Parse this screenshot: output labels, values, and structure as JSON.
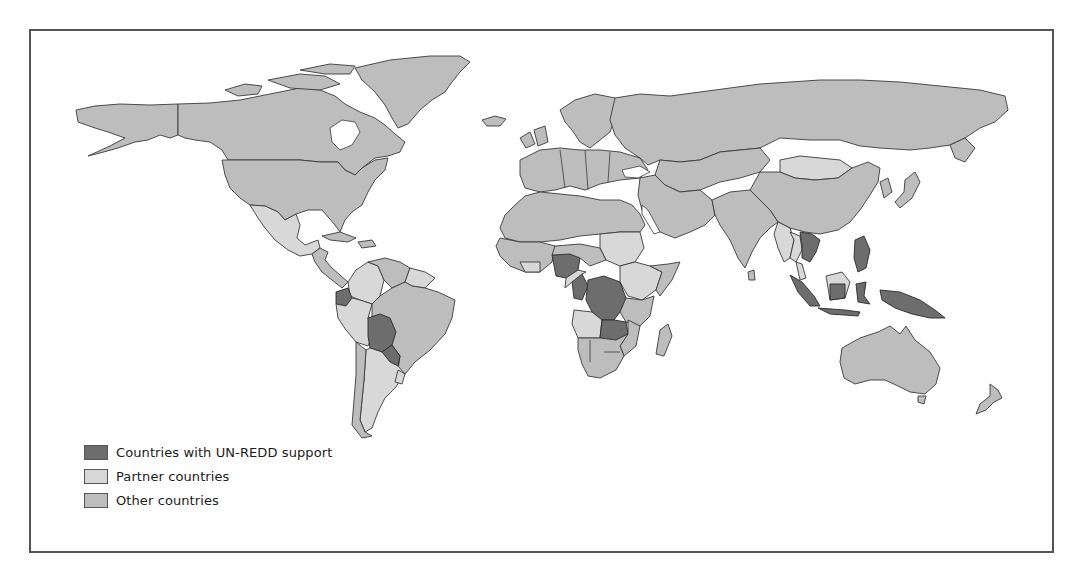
{
  "map": {
    "title": "",
    "colors": {
      "unredd": "#6d6d6d",
      "partner": "#d8d8d8",
      "other": "#bdbdbd",
      "border": "#3a3a3a",
      "frame": "#555555"
    }
  },
  "legend": {
    "items": [
      {
        "label": "Countries with UN-REDD support",
        "color": "#6d6d6d"
      },
      {
        "label": "Partner countries",
        "color": "#d8d8d8"
      },
      {
        "label": "Other countries",
        "color": "#bdbdbd"
      }
    ]
  }
}
